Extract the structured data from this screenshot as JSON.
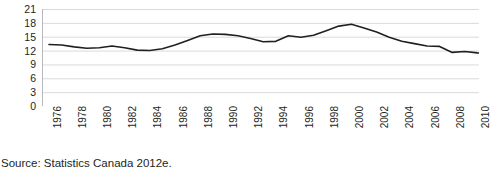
{
  "figure": {
    "title_ghost": "",
    "source_note": "Source: Statistics Canada 2012e."
  },
  "chart_data": {
    "type": "line",
    "title": "",
    "subtitle": "",
    "xlabel": "",
    "ylabel": "",
    "grid": true,
    "legend": false,
    "legend_position": "none",
    "line_color": "#231f20",
    "gridline_color": "#d9dadb",
    "axis_color": "#b6b8bb",
    "xlim": [
      1976,
      2011
    ],
    "ylim": [
      0,
      21
    ],
    "yticks": [
      0,
      3,
      6,
      9,
      12,
      15,
      18,
      21
    ],
    "ytick_labels": [
      "0",
      "3",
      "6",
      "9",
      "12",
      "15",
      "18",
      "21"
    ],
    "xticks": [
      1976,
      1978,
      1980,
      1982,
      1984,
      1986,
      1988,
      1990,
      1992,
      1994,
      1996,
      1998,
      2000,
      2002,
      2004,
      2006,
      2008,
      2010
    ],
    "xtick_labels": [
      "1976",
      "1978",
      "1980",
      "1982",
      "1984",
      "1986",
      "1988",
      "1990",
      "1992",
      "1994",
      "1996",
      "1998",
      "2000",
      "2002",
      "2004",
      "2006",
      "2008",
      "2010"
    ],
    "xtick_rotation": 90,
    "x": [
      1976,
      1977,
      1978,
      1979,
      1980,
      1981,
      1982,
      1983,
      1984,
      1985,
      1986,
      1987,
      1988,
      1989,
      1990,
      1991,
      1992,
      1993,
      1994,
      1995,
      1996,
      1997,
      1998,
      1999,
      2000,
      2001,
      2002,
      2003,
      2004,
      2005,
      2006,
      2007,
      2008,
      2009,
      2010,
      2011
    ],
    "values": [
      13.3,
      13.2,
      12.8,
      12.5,
      12.6,
      13.0,
      12.6,
      12.1,
      12.0,
      12.4,
      13.2,
      14.2,
      15.2,
      15.6,
      15.5,
      15.2,
      14.6,
      13.9,
      14.0,
      15.2,
      14.9,
      15.3,
      16.3,
      17.3,
      17.7,
      16.9,
      16.0,
      14.9,
      14.0,
      13.5,
      13.0,
      12.9,
      11.6,
      11.8,
      11.5,
      11.4
    ],
    "series": [
      {
        "name": "",
        "values": [
          13.3,
          13.2,
          12.8,
          12.5,
          12.6,
          13.0,
          12.6,
          12.1,
          12.0,
          12.4,
          13.2,
          14.2,
          15.2,
          15.6,
          15.5,
          15.2,
          14.6,
          13.9,
          14.0,
          15.2,
          14.9,
          15.3,
          16.3,
          17.3,
          17.7,
          16.9,
          16.0,
          14.9,
          14.0,
          13.5,
          13.0,
          12.9,
          11.6,
          11.8,
          11.5,
          11.4
        ]
      }
    ]
  }
}
